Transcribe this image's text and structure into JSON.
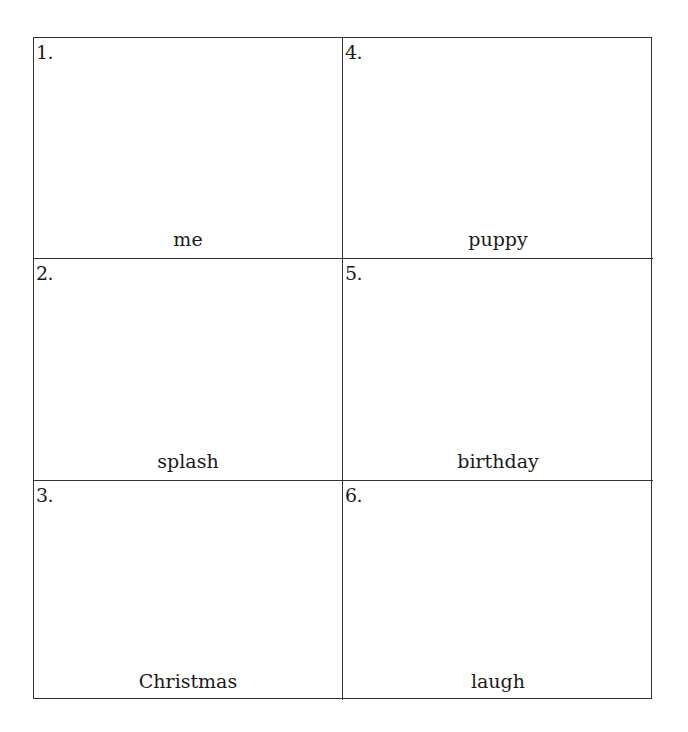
{
  "worksheet": {
    "cells": [
      {
        "number": "1.",
        "word": "me"
      },
      {
        "number": "4.",
        "word": "puppy"
      },
      {
        "number": "2.",
        "word": "splash"
      },
      {
        "number": "5.",
        "word": "birthday"
      },
      {
        "number": "3.",
        "word": "Christmas"
      },
      {
        "number": "6.",
        "word": "laugh"
      }
    ]
  }
}
